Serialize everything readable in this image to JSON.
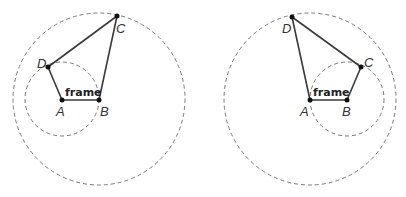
{
  "figures": [
    {
      "id": "left",
      "frame_label": "frame",
      "points": {
        "A": {
          "label": "A",
          "x": 62,
          "y": 100
        },
        "B": {
          "label": "B",
          "x": 99,
          "y": 100
        },
        "C": {
          "label": "C",
          "x": 117,
          "y": 16
        },
        "D": {
          "label": "D",
          "x": 48,
          "y": 67
        }
      },
      "circles": [
        {
          "name": "small",
          "cx": 62,
          "cy": 99,
          "r": 37
        },
        {
          "name": "large",
          "cx": 99,
          "cy": 99,
          "r": 86
        }
      ]
    },
    {
      "id": "right",
      "frame_label": "frame",
      "points": {
        "A": {
          "label": "A",
          "x": 310,
          "y": 100
        },
        "B": {
          "label": "B",
          "x": 347,
          "y": 100
        },
        "C": {
          "label": "C",
          "x": 361,
          "y": 67
        },
        "D": {
          "label": "D",
          "x": 292,
          "y": 17
        }
      },
      "circles": [
        {
          "name": "small",
          "cx": 347,
          "cy": 99,
          "r": 37
        },
        {
          "name": "large",
          "cx": 310,
          "cy": 99,
          "r": 86
        }
      ]
    }
  ],
  "colors": {
    "link": "#3a3a3a",
    "circle": "#7a7a7a",
    "joint": "#111111"
  }
}
